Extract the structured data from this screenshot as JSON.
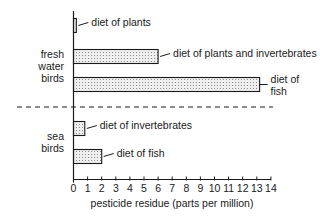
{
  "chart_data": {
    "type": "bar",
    "orientation": "horizontal",
    "title": "",
    "xlabel": "pesticide residue (parts per million)",
    "ylabel": "",
    "xlim": [
      0,
      14
    ],
    "xticks": [
      "0",
      "1",
      "2",
      "3",
      "4",
      "5",
      "6",
      "7",
      "8",
      "9",
      "10",
      "11",
      "12",
      "13",
      "14"
    ],
    "grid": false,
    "legend": "none",
    "groups": [
      {
        "name": "fresh water birds",
        "label_lines": [
          "fresh",
          "water",
          "birds"
        ],
        "bars": [
          {
            "label": "diet of plants",
            "label_lines": [
              "diet of plants"
            ],
            "value": 0.2
          },
          {
            "label": "diet of plants and invertebrates",
            "label_lines": [
              "diet of plants and invertebrates"
            ],
            "value": 6.0
          },
          {
            "label": "diet of fish",
            "label_lines": [
              "diet of",
              "fish"
            ],
            "value": 13.2
          }
        ]
      },
      {
        "name": "sea birds",
        "label_lines": [
          "sea",
          "birds"
        ],
        "bars": [
          {
            "label": "diet of invertebrates",
            "label_lines": [
              "diet of invertebrates"
            ],
            "value": 0.8
          },
          {
            "label": "diet of fish",
            "label_lines": [
              "diet of fish"
            ],
            "value": 2.0
          }
        ]
      }
    ],
    "categories": [
      "fresh water: diet of plants",
      "fresh water: diet of plants and invertebrates",
      "fresh water: diet of fish",
      "sea: diet of invertebrates",
      "sea: diet of fish"
    ],
    "values": [
      0.2,
      6.0,
      13.2,
      0.8,
      2.0
    ],
    "bar_fill": "stippled",
    "separator": "dashed line between fresh water and sea bird groups"
  },
  "colors": {
    "ink": "#1a1a1a",
    "bar_fill": "#ececec",
    "stipple": "#7a7a7a",
    "background": "#ffffff"
  }
}
